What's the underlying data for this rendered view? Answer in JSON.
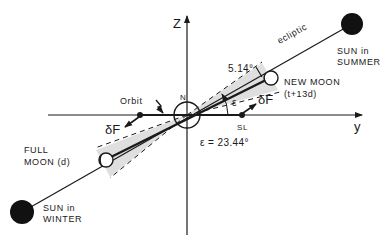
{
  "diagram": {
    "type": "geometry",
    "axes": {
      "z_label": "Z",
      "y_label": "y"
    },
    "center": {
      "label": "N"
    },
    "orbit_label": "Orbit",
    "sl_label": "SL",
    "ecliptic_label": "ecliptic",
    "inclination_label": "5.14°",
    "epsilon_symbol": "ε",
    "obliquity_label": "ε = 23.44°",
    "force_labels": [
      "δF",
      "δF"
    ],
    "new_moon": {
      "line1": "NEW MOON",
      "line2": "(t+13d)"
    },
    "full_moon": {
      "line1": "FULL",
      "line2": "MOON (d)"
    },
    "sun_summer": {
      "line1": "SUN in",
      "line2": "SUMMER"
    },
    "sun_winter": {
      "line1": "SUN in",
      "line2": "WINTER"
    },
    "colors": {
      "ink": "#1a1a1a",
      "shade": "#d9d9d9",
      "background": "#ffffff"
    }
  }
}
